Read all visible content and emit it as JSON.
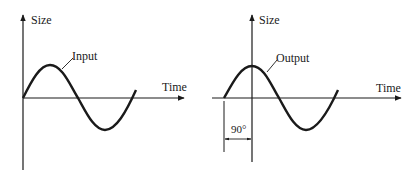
{
  "left_panel": {
    "y_axis_label": "Size",
    "x_axis_label": "Time",
    "curve_label": "Input"
  },
  "right_panel": {
    "y_axis_label": "Size",
    "x_axis_label": "Time",
    "curve_label": "Output",
    "phase_label": "90°"
  },
  "colors": {
    "ink": "#1a1a1a",
    "background": "#ffffff"
  }
}
